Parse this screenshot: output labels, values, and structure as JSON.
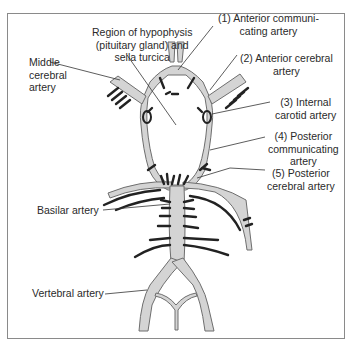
{
  "figure": {
    "colors": {
      "artery_fill": "#d4d4d4",
      "artery_stroke": "#6e6e6e",
      "branch": "#222222",
      "leader": "#333333",
      "frame": "#8a8a8a"
    }
  },
  "labels": {
    "hypophysis": {
      "line1": "Region of hypophysis",
      "line2": "(pituitary gland) and",
      "line3": "sella turcica"
    },
    "middle_cerebral": {
      "line1": "Middle",
      "line2": "cerebral",
      "line3": "artery"
    },
    "anterior_communicating": {
      "line1": "(1) Anterior communi-",
      "line2": "cating artery"
    },
    "anterior_cerebral": {
      "line1": "(2) Anterior cerebral",
      "line2": "artery"
    },
    "internal_carotid": {
      "line1": "(3) Internal",
      "line2": "carotid artery"
    },
    "posterior_communicating": {
      "line1": "(4) Posterior",
      "line2": "communicating",
      "line3": "artery"
    },
    "posterior_cerebral": {
      "line1": "(5) Posterior",
      "line2": "cerebral artery"
    },
    "basilar": {
      "line1": "Basilar artery"
    },
    "vertebral": {
      "line1": "Vertebral artery"
    }
  }
}
